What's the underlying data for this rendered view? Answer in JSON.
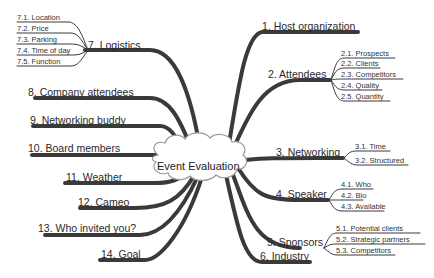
{
  "title": "Event Evaluation",
  "colors": {
    "branch": "#3a3a3a",
    "text": "#2a2a2a",
    "cloud_fill": "#ffffff",
    "cloud_stroke": "#9a9a9a"
  },
  "right_branches": [
    {
      "label": "1. Host organization",
      "children": []
    },
    {
      "label": "2. Attendees",
      "children": [
        "2.1. Prospects",
        "2.2. Clients",
        "2.3. Competitors",
        "2.4. Quality",
        "2.5. Quantity"
      ]
    },
    {
      "label": "3. Networking",
      "children": [
        "3.1. Time",
        "3.2. Structured"
      ]
    },
    {
      "label": "4. Speaker",
      "children": [
        "4.1. Who",
        "4.2. Bio",
        "4.3. Available"
      ]
    },
    {
      "label": "5. Sponsors",
      "children": [
        "5.1. Potential clients",
        "5.2. Strategic partners",
        "5.3. Competitors"
      ]
    },
    {
      "label": "6. Industry",
      "children": []
    }
  ],
  "left_branches": [
    {
      "label": "7. Logistics",
      "children": [
        "7.1. Location",
        "7.2. Price",
        "7.3. Parking",
        "7.4. Time of day",
        "7.5. Function"
      ]
    },
    {
      "label": "8. Company attendees",
      "children": []
    },
    {
      "label": "9. Networking buddy",
      "children": []
    },
    {
      "label": "10. Board members",
      "children": []
    },
    {
      "label": "11. Weather",
      "children": []
    },
    {
      "label": "12. Cameo",
      "children": []
    },
    {
      "label": "13. Who invited you?",
      "children": []
    },
    {
      "label": "14. Goal",
      "children": []
    }
  ]
}
